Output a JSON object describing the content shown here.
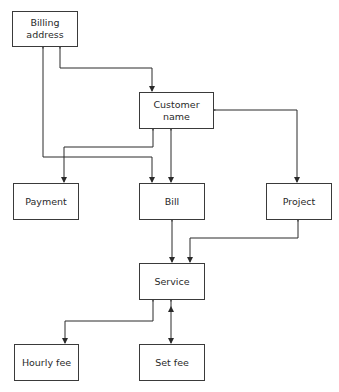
{
  "diagram": {
    "type": "entity-relationship",
    "line_color": "#2a2a2a",
    "nodes": [
      {
        "id": "billing_address",
        "label_line1": "Billing",
        "label_line2": "address"
      },
      {
        "id": "customer_name",
        "label_line1": "Customer",
        "label_line2": "name"
      },
      {
        "id": "payment",
        "label": "Payment"
      },
      {
        "id": "bill",
        "label": "Bill"
      },
      {
        "id": "project",
        "label": "Project"
      },
      {
        "id": "service",
        "label": "Service"
      },
      {
        "id": "hourly_fee",
        "label": "Hourly fee"
      },
      {
        "id": "set_fee",
        "label": "Set fee"
      }
    ],
    "edges": [
      {
        "from": "billing_address",
        "to": "customer_name",
        "arrows": "both"
      },
      {
        "from": "billing_address",
        "to": "bill",
        "arrows": "both"
      },
      {
        "from": "customer_name",
        "to": "payment",
        "arrows": "both"
      },
      {
        "from": "customer_name",
        "to": "bill",
        "arrows": "both"
      },
      {
        "from": "customer_name",
        "to": "project",
        "arrows": "both"
      },
      {
        "from": "bill",
        "to": "service",
        "arrows": "both"
      },
      {
        "from": "project",
        "to": "service",
        "arrows": "both"
      },
      {
        "from": "service",
        "to": "hourly_fee",
        "arrows": "both"
      },
      {
        "from": "service",
        "to": "set_fee",
        "arrows": "both"
      }
    ]
  }
}
